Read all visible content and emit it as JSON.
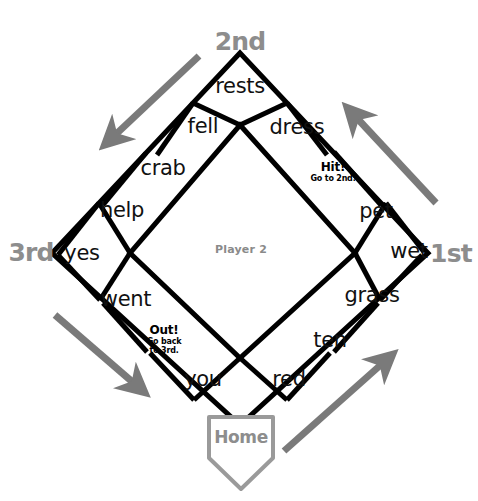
{
  "board": {
    "title": "Baseball Word Game Board",
    "player_label": "Player 2",
    "line_color": "#000000",
    "accent_gray": "#8d8d8d",
    "arrow_color": "#7a7a7a",
    "background": "#ffffff"
  },
  "bases": [
    {
      "id": "second",
      "label": "2nd"
    },
    {
      "id": "third",
      "label": "3rd"
    },
    {
      "id": "first",
      "label": "1st"
    },
    {
      "id": "home",
      "label": "Home"
    }
  ],
  "cells": [
    {
      "id": "cell-rests",
      "word": "rests",
      "type": "word"
    },
    {
      "id": "cell-dress",
      "word": "dress",
      "type": "word"
    },
    {
      "id": "cell-hit",
      "word": "Hit!",
      "type": "special",
      "sub": "Go to 2nd."
    },
    {
      "id": "cell-pet",
      "word": "pet",
      "type": "word"
    },
    {
      "id": "cell-wet",
      "word": "wet",
      "type": "word"
    },
    {
      "id": "cell-grass",
      "word": "grass",
      "type": "word"
    },
    {
      "id": "cell-ten",
      "word": "ten",
      "type": "word"
    },
    {
      "id": "cell-red",
      "word": "red",
      "type": "word"
    },
    {
      "id": "cell-you",
      "word": "you",
      "type": "word"
    },
    {
      "id": "cell-out",
      "word": "Out!",
      "type": "special",
      "sub": "Go back to 3rd."
    },
    {
      "id": "cell-went",
      "word": "went",
      "type": "word"
    },
    {
      "id": "cell-yes",
      "word": "yes",
      "type": "word"
    },
    {
      "id": "cell-help",
      "word": "help",
      "type": "word"
    },
    {
      "id": "cell-crab",
      "word": "crab",
      "type": "word"
    },
    {
      "id": "cell-fell",
      "word": "fell",
      "type": "word"
    }
  ],
  "special_lines": {
    "hit_sub": "Go to 2nd.",
    "out_sub_line1": "Go back",
    "out_sub_line2": "to 3rd."
  },
  "arrows": [
    {
      "id": "arrow-home-to-first",
      "direction": "up-right",
      "label": ""
    },
    {
      "id": "arrow-first-to-second",
      "direction": "up-left",
      "label": ""
    },
    {
      "id": "arrow-second-to-third",
      "direction": "down-left",
      "label": ""
    },
    {
      "id": "arrow-third-to-home",
      "direction": "down-right",
      "label": ""
    }
  ]
}
